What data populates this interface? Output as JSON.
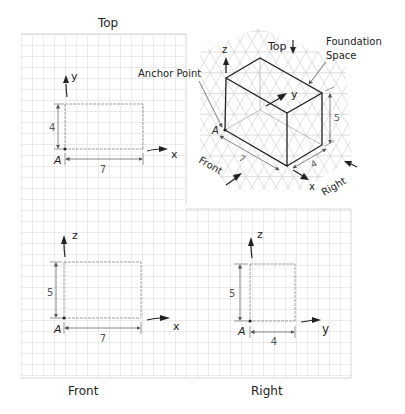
{
  "colors": {
    "grid": "#cfcfcf",
    "iso_grid": "#d2d2d2",
    "ink": "#222222",
    "dim_line": "#555555",
    "faint_line": "#8a8a8a"
  },
  "top_view": {
    "title": "Top",
    "axis_vertical": "y",
    "axis_horizontal": "x",
    "anchor": "A",
    "width_dim": "7",
    "height_dim": "4"
  },
  "front_view": {
    "title": "Front",
    "axis_vertical": "z",
    "axis_horizontal": "x",
    "anchor": "A",
    "width_dim": "7",
    "height_dim": "5"
  },
  "right_view": {
    "title": "Right",
    "axis_vertical": "z",
    "axis_horizontal": "y",
    "anchor": "A",
    "width_dim": "4",
    "height_dim": "5"
  },
  "isometric": {
    "anchor_label": "Anchor Point",
    "foundation_label_line1": "Foundation",
    "foundation_label_line2": "Space",
    "top_label": "Top",
    "front_label": "Front",
    "right_label": "Right",
    "axis_z": "z",
    "axis_y": "y",
    "axis_x": "x",
    "anchor": "A",
    "length_dim": "7",
    "depth_dim": "4",
    "height_dim": "5"
  }
}
